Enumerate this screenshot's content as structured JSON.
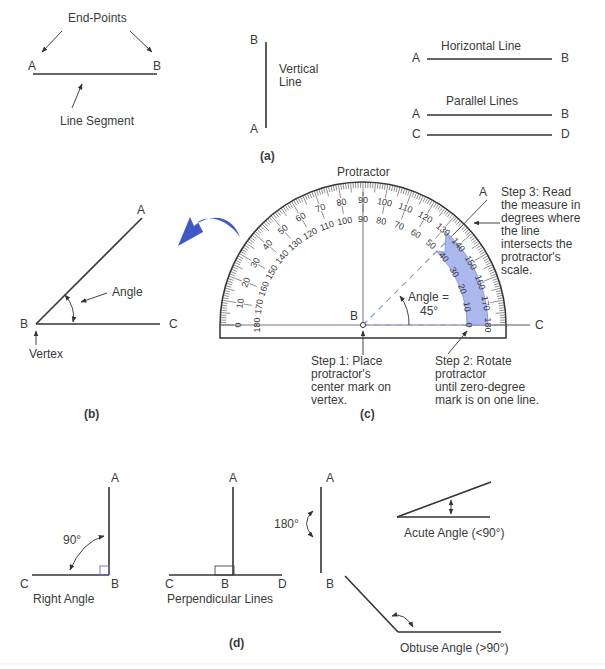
{
  "panel_a": {
    "caption": "(a)",
    "segment": {
      "title": "End-Points",
      "label_a": "A",
      "label_b": "B",
      "caption": "Line Segment"
    },
    "vertical": {
      "label_top": "B",
      "label_bottom": "A",
      "caption_line1": "Vertical",
      "caption_line2": "Line"
    },
    "horizontal": {
      "title": "Horizontal Line",
      "label_a": "A",
      "label_b": "B"
    },
    "parallel": {
      "title": "Parallel Lines",
      "label_a": "A",
      "label_b": "B",
      "label_c": "C",
      "label_d": "D"
    }
  },
  "panel_b": {
    "caption": "(b)",
    "label_a": "A",
    "label_b": "B",
    "label_c": "C",
    "angle_label": "Angle",
    "vertex_label": "Vertex"
  },
  "panel_c": {
    "caption": "(c)",
    "title": "Protractor",
    "label_a": "A",
    "label_b": "B",
    "label_c": "C",
    "angle_line1": "Angle =",
    "angle_line2": "45°",
    "outer_scale": [
      "0",
      "10",
      "20",
      "30",
      "40",
      "50",
      "60",
      "70",
      "80",
      "90",
      "100",
      "110",
      "120",
      "130",
      "140",
      "150",
      "160",
      "170",
      "180"
    ],
    "inner_scale": [
      "180",
      "170",
      "160",
      "150",
      "140",
      "130",
      "120",
      "110",
      "100",
      "90",
      "80",
      "70",
      "60",
      "50",
      "40",
      "30",
      "20",
      "10",
      "0"
    ],
    "step1": [
      "Step 1: Place",
      "protractor's",
      "center mark on",
      "vertex."
    ],
    "step2": [
      "Step 2: Rotate",
      "protractor",
      "until zero-degree",
      "mark is on one line."
    ],
    "step3": [
      "Step 3: Read",
      "the measure in",
      "degrees where",
      "the line",
      "intersects the",
      "protractor's",
      "scale."
    ],
    "highlight_color": "#aab8ee",
    "arrow_color": "#3f57c9"
  },
  "panel_d": {
    "caption": "(d)",
    "right_angle": {
      "label_a": "A",
      "label_b": "B",
      "label_c": "C",
      "degrees": "90°",
      "caption": "Right Angle"
    },
    "perpendicular": {
      "label_a": "A",
      "label_b": "B",
      "label_c": "C",
      "label_d": "D",
      "caption": "Perpendicular Lines"
    },
    "straight": {
      "label_a": "A",
      "label_b": "B",
      "degrees": "180°"
    },
    "acute": {
      "caption": "Acute Angle (<90°)"
    },
    "obtuse": {
      "caption": "Obtuse Angle (>90°)"
    }
  }
}
